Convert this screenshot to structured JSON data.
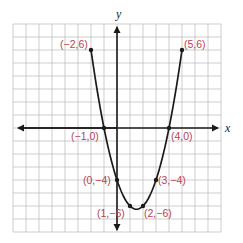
{
  "chart_data": {
    "type": "line",
    "title": "",
    "xlabel": "x",
    "ylabel": "y",
    "xlim": [
      -8,
      8
    ],
    "ylim": [
      -8,
      8
    ],
    "grid": true,
    "function": "y = x^2 - 3x - 4",
    "points": [
      {
        "x": -2,
        "y": 6,
        "label": "(−2,6)"
      },
      {
        "x": -1,
        "y": 0,
        "label": "(−1,0)"
      },
      {
        "x": 0,
        "y": -4,
        "label": "(0,−4)"
      },
      {
        "x": 1,
        "y": -6,
        "label": "(1,−6)"
      },
      {
        "x": 2,
        "y": -6,
        "label": "(2,−6)"
      },
      {
        "x": 3,
        "y": -4,
        "label": "(3,−4)"
      },
      {
        "x": 4,
        "y": 0,
        "label": "(4,0)"
      },
      {
        "x": 5,
        "y": 6,
        "label": "(5,6)"
      }
    ]
  },
  "colors": {
    "label": "#b8434f",
    "curve": "#1a1a1a",
    "grid": "#b9b9b9"
  },
  "axes": {
    "x_label": "x",
    "y_label": "y"
  },
  "labels": {
    "p_m2_6": "(−2,6)",
    "p_m1_0": "(−1,0)",
    "p_0_m4": "(0,−4)",
    "p_1_m6": "(1,−6)",
    "p_2_m6": "(2,−6)",
    "p_3_m4": "(3,−4)",
    "p_4_0": "(4,0)",
    "p_5_6": "(5,6)"
  }
}
